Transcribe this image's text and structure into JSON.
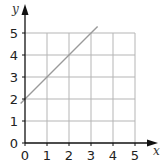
{
  "chart_data": {
    "type": "line",
    "title": "",
    "xlabel": "x",
    "ylabel": "y",
    "xlim": [
      0,
      5.5
    ],
    "ylim": [
      0,
      5.5
    ],
    "x_ticks": [
      "0",
      "1",
      "2",
      "3",
      "4",
      "5"
    ],
    "y_ticks": [
      "0",
      "1",
      "2",
      "3",
      "4",
      "5"
    ],
    "grid": true,
    "legend": null,
    "series": [
      {
        "name": "y = x + 2",
        "x": [
          -0.2,
          0,
          1,
          2,
          3,
          3.3
        ],
        "y": [
          1.8,
          2,
          3,
          4,
          5,
          5.3
        ],
        "color": "#9a9a9a"
      }
    ]
  },
  "colors": {
    "axis": "#111111",
    "grid": "#b5b5b5",
    "line": "#9a9a9a"
  }
}
